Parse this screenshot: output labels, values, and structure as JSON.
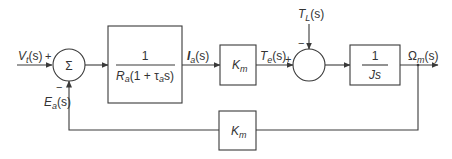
{
  "diagram": {
    "type": "block-diagram",
    "inputs": {
      "voltage": {
        "base": "V",
        "sub": "t",
        "arg": "(s)",
        "sign": "+"
      },
      "load_torque": {
        "base": "T",
        "sub": "L",
        "arg": "(s)",
        "sign": "−"
      }
    },
    "summers": [
      {
        "id": "sum1",
        "symbol": "Σ"
      },
      {
        "id": "sum2",
        "symbol": ""
      }
    ],
    "blocks": [
      {
        "id": "armature",
        "numerator": "1",
        "den_R": "R",
        "den_R_sub": "a",
        "den_open": "(1 + ",
        "den_tau": "τ",
        "den_tau_sub": "a",
        "den_close": "s)"
      },
      {
        "id": "torque_const",
        "base": "K",
        "sub": "m"
      },
      {
        "id": "inertia",
        "numerator": "1",
        "denominator": "Js"
      },
      {
        "id": "back_emf_const",
        "base": "K",
        "sub": "m"
      }
    ],
    "signals": {
      "current": {
        "base": "I",
        "sub": "a",
        "arg": "(s)"
      },
      "torque": {
        "base": "T",
        "sub": "e",
        "arg": "(s)",
        "sign": "+"
      },
      "speed": {
        "base": "Ω",
        "sub": "m",
        "arg": "(s)"
      },
      "back_emf": {
        "base": "E",
        "sub": "a",
        "arg": "(s)",
        "sign": "−"
      }
    }
  }
}
